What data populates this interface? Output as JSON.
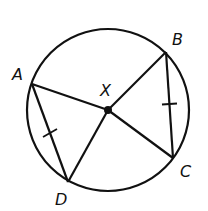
{
  "diagram": {
    "type": "circle-geometry",
    "stroke_color": "#111111",
    "background": "#ffffff",
    "circle": {
      "cx": 108,
      "cy": 110,
      "r": 81
    },
    "center": {
      "name": "X",
      "x": 108,
      "y": 110
    },
    "points": [
      {
        "name": "A",
        "x": 32,
        "y": 84,
        "label_x": 12,
        "label_y": 80
      },
      {
        "name": "B",
        "x": 166,
        "y": 52,
        "label_x": 172,
        "label_y": 45
      },
      {
        "name": "C",
        "x": 173,
        "y": 158,
        "label_x": 180,
        "label_y": 177
      },
      {
        "name": "D",
        "x": 68,
        "y": 182,
        "label_x": 56,
        "label_y": 205
      }
    ],
    "labels": {
      "A": "A",
      "B": "B",
      "C": "C",
      "D": "D",
      "X": "X"
    },
    "segments": [
      {
        "from": "A",
        "to": "X",
        "kind": "radius"
      },
      {
        "from": "B",
        "to": "X",
        "kind": "radius"
      },
      {
        "from": "C",
        "to": "X",
        "kind": "radius"
      },
      {
        "from": "D",
        "to": "X",
        "kind": "radius"
      },
      {
        "from": "A",
        "to": "D",
        "kind": "chord",
        "tick_marks": 1
      },
      {
        "from": "B",
        "to": "C",
        "kind": "chord",
        "tick_marks": 1
      }
    ],
    "congruence": "AD ≅ BC"
  }
}
